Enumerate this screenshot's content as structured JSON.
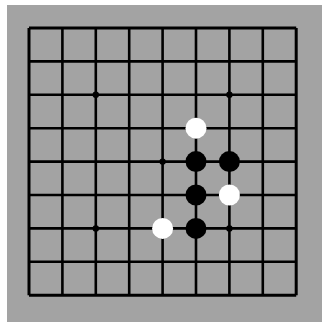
{
  "game": "Go",
  "board": {
    "size": 9,
    "origin_x": 29,
    "origin_y": 28,
    "spacing": 33.4,
    "board_color": "#a3a3a3",
    "line_color": "#000000",
    "star_points": [
      [
        2,
        2
      ],
      [
        6,
        2
      ],
      [
        4,
        4
      ],
      [
        2,
        6
      ],
      [
        6,
        6
      ]
    ]
  },
  "stones": [
    {
      "color": "white",
      "col": 5,
      "row": 3
    },
    {
      "color": "black",
      "col": 5,
      "row": 4
    },
    {
      "color": "black",
      "col": 6,
      "row": 4
    },
    {
      "color": "black",
      "col": 5,
      "row": 5
    },
    {
      "color": "white",
      "col": 6,
      "row": 5
    },
    {
      "color": "white",
      "col": 4,
      "row": 6
    },
    {
      "color": "black",
      "col": 5,
      "row": 6
    }
  ]
}
